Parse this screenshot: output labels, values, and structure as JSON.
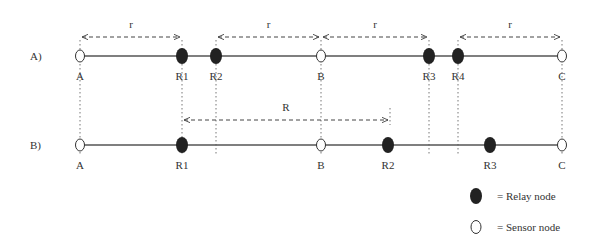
{
  "diagram": {
    "rows": [
      {
        "label": "A)",
        "y": 56,
        "nodes": [
          {
            "name": "A",
            "type": "sensor",
            "x": 80
          },
          {
            "name": "R1",
            "type": "relay",
            "x": 182
          },
          {
            "name": "R2",
            "type": "relay",
            "x": 216
          },
          {
            "name": "B",
            "type": "sensor",
            "x": 321
          },
          {
            "name": "R3",
            "type": "relay",
            "x": 429
          },
          {
            "name": "R4",
            "type": "relay",
            "x": 458
          },
          {
            "name": "C",
            "type": "sensor",
            "x": 562
          }
        ],
        "ranges": [
          {
            "label": "r",
            "from": 80,
            "to": 182
          },
          {
            "label": "r",
            "from": 216,
            "to": 321
          },
          {
            "label": "r",
            "from": 321,
            "to": 429
          },
          {
            "label": "r",
            "from": 458,
            "to": 562
          }
        ]
      },
      {
        "label": "B)",
        "y": 145,
        "nodes": [
          {
            "name": "A",
            "type": "sensor",
            "x": 80
          },
          {
            "name": "R1",
            "type": "relay",
            "x": 182
          },
          {
            "name": "B",
            "type": "sensor",
            "x": 321
          },
          {
            "name": "R2",
            "type": "relay",
            "x": 388
          },
          {
            "name": "R3",
            "type": "relay",
            "x": 490
          },
          {
            "name": "C",
            "type": "sensor",
            "x": 562
          }
        ],
        "ranges": [
          {
            "label": "R",
            "from": 182,
            "to": 390
          }
        ]
      }
    ],
    "legend": [
      {
        "symbol": "relay",
        "text": "= Relay node"
      },
      {
        "symbol": "sensor",
        "text": "= Sensor node"
      }
    ]
  }
}
